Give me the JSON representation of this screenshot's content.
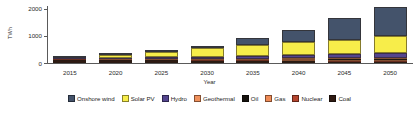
{
  "chart_data": {
    "type": "bar",
    "stacked": true,
    "title": "",
    "xlabel": "Year",
    "ylabel": "TWh",
    "categories": [
      "2015",
      "2020",
      "2025",
      "2030",
      "2035",
      "2040",
      "2045",
      "2050"
    ],
    "ylim": [
      0,
      2100
    ],
    "yticks": [
      0,
      1000,
      2000
    ],
    "ytick_labels": [
      "0",
      "1000",
      "2000"
    ],
    "grid": false,
    "legend_position": "bottom",
    "series": [
      {
        "name": "Coal",
        "color": "#2e1a12",
        "values": [
          118,
          108,
          96,
          84,
          70,
          58,
          44,
          30
        ]
      },
      {
        "name": "Nuclear",
        "color": "#b5452f",
        "values": [
          18,
          20,
          22,
          24,
          26,
          28,
          30,
          32
        ]
      },
      {
        "name": "Gas",
        "color": "#ef8b56",
        "values": [
          14,
          18,
          24,
          30,
          36,
          44,
          52,
          60
        ]
      },
      {
        "name": "Oil",
        "color": "#16120e",
        "values": [
          10,
          12,
          14,
          16,
          18,
          20,
          22,
          24
        ]
      },
      {
        "name": "Geothermal",
        "color": "#f0915c",
        "values": [
          4,
          6,
          8,
          12,
          16,
          20,
          26,
          32
        ]
      },
      {
        "name": "Hydro",
        "color": "#54458f",
        "values": [
          20,
          34,
          52,
          72,
          96,
          120,
          150,
          182
        ]
      },
      {
        "name": "Solar PV",
        "color": "#f7ed4a",
        "values": [
          8,
          86,
          200,
          300,
          420,
          480,
          540,
          620
        ]
      },
      {
        "name": "Onshore wind",
        "color": "#44536b",
        "values": [
          6,
          18,
          44,
          92,
          248,
          460,
          780,
          1080
        ]
      }
    ]
  },
  "legend": {
    "items": [
      {
        "label": "Onshore wind",
        "color": "#44536b"
      },
      {
        "label": "Solar PV",
        "color": "#f7ed4a"
      },
      {
        "label": "Hydro",
        "color": "#54458f"
      },
      {
        "label": "Geothermal",
        "color": "#f0915c"
      },
      {
        "label": "Oil",
        "color": "#16120e"
      },
      {
        "label": "Gas",
        "color": "#ef8b56"
      },
      {
        "label": "Nuclear",
        "color": "#b5452f"
      },
      {
        "label": "Coal",
        "color": "#2e1a12"
      }
    ]
  }
}
